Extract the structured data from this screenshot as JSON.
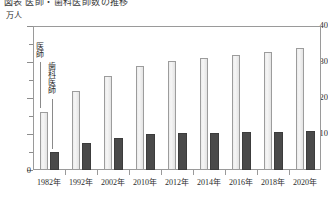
{
  "chart_data": {
    "type": "bar",
    "title": "図表 医師・歯科医師数の推移",
    "ylabel": "万人",
    "xlabel": "",
    "ylim": [
      0,
      40
    ],
    "yticks": [
      0,
      10,
      20,
      30,
      40
    ],
    "ytick_labels": [
      "0",
      "10",
      "20",
      "30",
      "40"
    ],
    "yminor_step": 5,
    "grid": false,
    "legend_position": "inside-left",
    "categories": [
      "1982年",
      "1992年",
      "2002年",
      "2010年",
      "2012年",
      "2014年",
      "2016年",
      "2018年",
      "2020年"
    ],
    "series": [
      {
        "name": "医師",
        "color": "#ececec",
        "edge_color": "#9c9c9c",
        "values": [
          16.0,
          22.0,
          26.2,
          29.0,
          30.3,
          31.1,
          31.9,
          32.7,
          33.9
        ]
      },
      {
        "name": "歯科医師",
        "color": "#4a4a4a",
        "edge_color": "#3c3c3c",
        "values": [
          5.0,
          7.5,
          9.0,
          10.0,
          10.2,
          10.4,
          10.5,
          10.5,
          10.7
        ]
      }
    ]
  },
  "axis": {
    "unit_label": "万人",
    "zero_label": "0"
  }
}
